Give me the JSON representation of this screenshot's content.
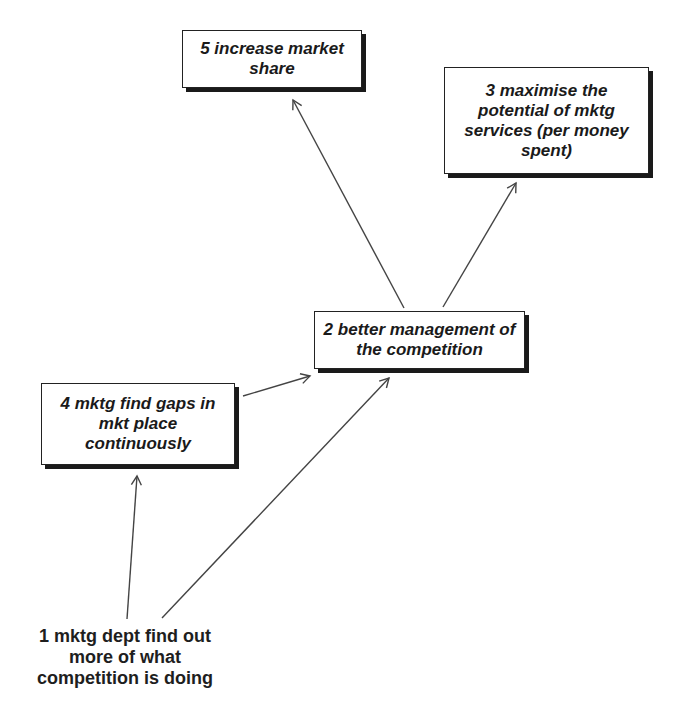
{
  "diagram": {
    "type": "cause-effect-map",
    "nodes": [
      {
        "id": "1",
        "label": "1 mktg dept find out more of what competition is doing",
        "boxed": false
      },
      {
        "id": "2",
        "label": "2 better management of the competition",
        "boxed": true
      },
      {
        "id": "3",
        "label": "3 maximise the potential of mktg services (per money spent)",
        "boxed": true
      },
      {
        "id": "4",
        "label": "4 mktg find gaps in mkt place continuously",
        "boxed": true
      },
      {
        "id": "5",
        "label": "5 increase market share",
        "boxed": true
      }
    ],
    "edges": [
      {
        "from": "1",
        "to": "4"
      },
      {
        "from": "1",
        "to": "2"
      },
      {
        "from": "4",
        "to": "2"
      },
      {
        "from": "2",
        "to": "5"
      },
      {
        "from": "2",
        "to": "3"
      }
    ],
    "colors": {
      "background": "#ffffff",
      "line": "#444444",
      "text": "#1a1a1a",
      "shadow": "#1a1a1a"
    }
  }
}
